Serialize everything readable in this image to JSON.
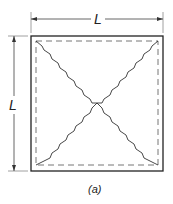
{
  "figure": {
    "caption": "(a)",
    "dimensions": {
      "top_label": "L",
      "left_label": "L"
    },
    "elements": {
      "outer_square": "solid",
      "inner_square": "dashed",
      "diagonals": "wavy-crossed"
    },
    "colors": {
      "line": "#333333",
      "dim_line": "#666666",
      "dashed": "#777777"
    }
  }
}
